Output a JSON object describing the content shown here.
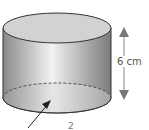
{
  "diagram": {
    "shape": "cylinder",
    "height_label": "6 cm",
    "arrow_pointer_label": "",
    "bottom_partial_text": "2",
    "colors": {
      "body_light": "#f2f2f2",
      "body_dark": "#8a8a8a",
      "top_face": "#cfcfcf",
      "outline": "#333333",
      "dimension_arrow": "#777777"
    }
  }
}
